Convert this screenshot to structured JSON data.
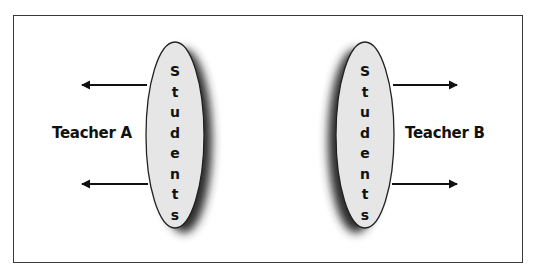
{
  "diagram": {
    "groups": [
      {
        "id": "A",
        "ellipse_label": "Students",
        "letters": [
          "S",
          "t",
          "u",
          "d",
          "e",
          "n",
          "t",
          "s"
        ],
        "teacher_label": "Teacher A",
        "arrow_direction": "left",
        "arrow_count": 2
      },
      {
        "id": "B",
        "ellipse_label": "Students",
        "letters": [
          "S",
          "t",
          "u",
          "d",
          "e",
          "n",
          "t",
          "s"
        ],
        "teacher_label": "Teacher B",
        "arrow_direction": "right",
        "arrow_count": 2
      }
    ],
    "colors": {
      "ellipse_fill": "#e6e6e6",
      "ellipse_stroke": "#222222",
      "shadow": "#2a2a2a",
      "arrow": "#111111",
      "frame": "#3a3a3a"
    }
  }
}
